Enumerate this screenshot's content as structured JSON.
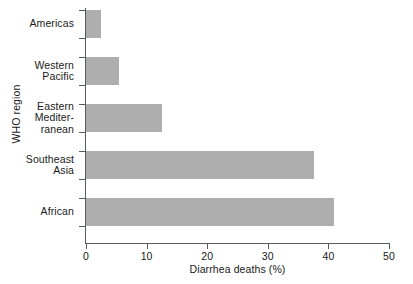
{
  "chart_data": {
    "type": "bar",
    "orientation": "horizontal",
    "title": "",
    "xlabel": "Diarrhea deaths (%)",
    "ylabel": "WHO region",
    "categories": [
      "Americas",
      "Western\nPacific",
      "Eastern\nMediter-\nranean",
      "Southeast\nAsia",
      "African"
    ],
    "values": [
      2.5,
      5.4,
      12.5,
      37.7,
      41.0
    ],
    "xlim": [
      0,
      50
    ],
    "xticks": [
      0,
      10,
      20,
      30,
      40,
      50
    ],
    "xtick_labels": [
      "0",
      "10",
      "20",
      "30",
      "40",
      "50"
    ],
    "grid": false,
    "legend": false,
    "bar_color": "#aeaeae",
    "axis_color": "#555b5e"
  },
  "axis": {
    "y_title": "WHO region",
    "x_title": "Diarrhea deaths (%)"
  },
  "categories": [
    {
      "id": "americas",
      "lines": [
        "Americas"
      ],
      "value": 2.5
    },
    {
      "id": "western-pacific",
      "lines": [
        "Western",
        "Pacific"
      ],
      "value": 5.4
    },
    {
      "id": "eastern-mediterranean",
      "lines": [
        "Eastern",
        "Mediter-",
        "ranean"
      ],
      "value": 12.5
    },
    {
      "id": "southeast-asia",
      "lines": [
        "Southeast",
        "Asia"
      ],
      "value": 37.7
    },
    {
      "id": "african",
      "lines": [
        "African"
      ],
      "value": 41.0
    }
  ],
  "xticks": [
    {
      "label": "0",
      "value": 0
    },
    {
      "label": "10",
      "value": 10
    },
    {
      "label": "20",
      "value": 20
    },
    {
      "label": "30",
      "value": 30
    },
    {
      "label": "40",
      "value": 40
    },
    {
      "label": "50",
      "value": 50
    }
  ]
}
